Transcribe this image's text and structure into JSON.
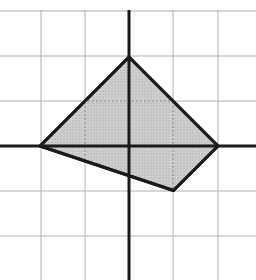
{
  "diagram": {
    "type": "coordinate-grid-polygon",
    "grid": {
      "x_lines_px": [
        41,
        85,
        173,
        218
      ],
      "y_lines_px": [
        11,
        56,
        101,
        191,
        236
      ],
      "grid_color": "#b0b0b0",
      "axis_color": "#1a1a1a"
    },
    "axes": {
      "origin_px": [
        129,
        146
      ],
      "unit_px": 44.5
    },
    "polygon": {
      "vertices": [
        [
          -2,
          0
        ],
        [
          0,
          2
        ],
        [
          2,
          0
        ],
        [
          1,
          -1
        ]
      ],
      "fill": "#c8c8c8",
      "stroke": "#1a1a1a"
    }
  }
}
